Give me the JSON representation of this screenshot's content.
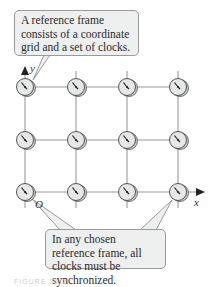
{
  "callouts": {
    "top": "A reference frame consists of a coordinate grid and a set of clocks.",
    "bottom": "In any chosen reference frame, all clocks must be synchronized."
  },
  "axes": {
    "x_label": "x",
    "y_label": "y",
    "origin_label": "O"
  },
  "grid": {
    "columns": 4,
    "rows": 3,
    "clock_count": 12
  },
  "caption": "FIGURE 36.2",
  "colors": {
    "callout_fill": "#eef0ef",
    "grid_line": "#888888",
    "clock_face": "#e6e8e7"
  }
}
